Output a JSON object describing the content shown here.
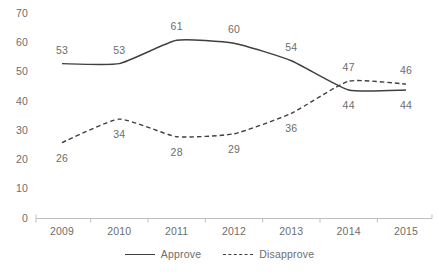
{
  "chart_data": {
    "type": "line",
    "title": "",
    "subtitle": "",
    "xlabel": "",
    "ylabel": "",
    "categories": [
      "2009",
      "2010",
      "2011",
      "2012",
      "2013",
      "2014",
      "2015"
    ],
    "series": [
      {
        "name": "Approve",
        "style": "solid",
        "color": "#3f3f3f",
        "values": [
          53,
          53,
          61,
          60,
          54,
          44,
          44
        ],
        "label_positions": [
          "above",
          "above",
          "above",
          "above",
          "above",
          "below",
          "below"
        ]
      },
      {
        "name": "Disapprove",
        "style": "dashed",
        "color": "#3f3f3f",
        "values": [
          26,
          34,
          28,
          29,
          36,
          47,
          46
        ],
        "label_positions": [
          "below",
          "below",
          "below",
          "below",
          "below",
          "above",
          "above"
        ]
      }
    ],
    "ylim": [
      0,
      70
    ],
    "yticks": [
      "0",
      "10",
      "20",
      "30",
      "40",
      "50",
      "60",
      "70"
    ],
    "grid": false,
    "legend_position": "bottom-center",
    "smoothed": true,
    "axis_color": "#bfbfbf",
    "text_color": "#6d6d6d"
  },
  "legend": {
    "entries": [
      {
        "label": "Approve"
      },
      {
        "label": "Disapprove"
      }
    ]
  },
  "icons": {
    "line-solid": "line-solid-icon",
    "line-dashed": "line-dashed-icon"
  }
}
